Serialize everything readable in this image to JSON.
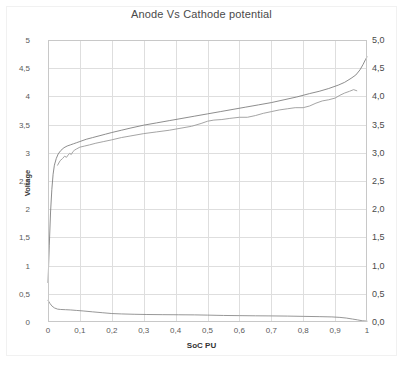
{
  "chart_data": {
    "type": "line",
    "title": "Anode Vs Cathode potential",
    "xlabel": "SoC PU",
    "ylabel": "Voltage",
    "grid": true,
    "legend": "none",
    "xlim": [
      0,
      1
    ],
    "ylim": [
      0,
      5
    ],
    "x_ticks": [
      0,
      0.1,
      0.2,
      0.3,
      0.4,
      0.5,
      0.6,
      0.7,
      0.8,
      0.9,
      1
    ],
    "x_tick_labels": [
      "0",
      "0,1",
      "0,2",
      "0,3",
      "0,4",
      "0,5",
      "0,6",
      "0,7",
      "0,8",
      "0,9",
      "1"
    ],
    "y_ticks_left": [
      0,
      0.5,
      1,
      1.5,
      2,
      2.5,
      3,
      3.5,
      4,
      4.5,
      5
    ],
    "y_tick_labels_left": [
      "0",
      "0,5",
      "1",
      "1,5",
      "2",
      "2,5",
      "3",
      "3,5",
      "4",
      "4,5",
      "5"
    ],
    "y_ticks_right": [
      0,
      0.5,
      1,
      1.5,
      2,
      2.5,
      3,
      3.5,
      4,
      4.5,
      5
    ],
    "y_tick_labels_right": [
      "0,0",
      "0,5",
      "1,0",
      "1,5",
      "2,0",
      "2,5",
      "3,0",
      "3,5",
      "4,0",
      "4,5",
      "5,0"
    ],
    "series": [
      {
        "name": "Cathode potential",
        "axis": "left",
        "color": "#808080",
        "x": [
          0.0,
          0.004,
          0.008,
          0.012,
          0.016,
          0.02,
          0.026,
          0.032,
          0.04,
          0.05,
          0.06,
          0.07,
          0.08,
          0.09,
          0.1,
          0.12,
          0.14,
          0.16,
          0.18,
          0.2,
          0.23,
          0.26,
          0.3,
          0.34,
          0.38,
          0.42,
          0.46,
          0.5,
          0.54,
          0.58,
          0.62,
          0.66,
          0.7,
          0.74,
          0.78,
          0.82,
          0.85,
          0.88,
          0.91,
          0.93,
          0.95,
          0.965,
          0.978,
          0.988,
          0.995,
          1.0
        ],
        "y": [
          0.7,
          1.35,
          1.95,
          2.35,
          2.62,
          2.78,
          2.9,
          2.98,
          3.04,
          3.09,
          3.12,
          3.14,
          3.16,
          3.18,
          3.2,
          3.24,
          3.27,
          3.3,
          3.33,
          3.36,
          3.4,
          3.44,
          3.49,
          3.53,
          3.57,
          3.61,
          3.65,
          3.69,
          3.73,
          3.77,
          3.81,
          3.85,
          3.89,
          3.94,
          3.99,
          4.05,
          4.09,
          4.14,
          4.2,
          4.25,
          4.32,
          4.38,
          4.47,
          4.57,
          4.65,
          4.7
        ]
      },
      {
        "name": "Cell potential",
        "axis": "left",
        "color": "#9a9a9a",
        "x": [
          0.03,
          0.038,
          0.046,
          0.052,
          0.058,
          0.063,
          0.068,
          0.073,
          0.078,
          0.084,
          0.09,
          0.1,
          0.115,
          0.13,
          0.15,
          0.175,
          0.2,
          0.23,
          0.26,
          0.3,
          0.34,
          0.38,
          0.42,
          0.45,
          0.48,
          0.5,
          0.52,
          0.545,
          0.57,
          0.6,
          0.625,
          0.65,
          0.675,
          0.7,
          0.725,
          0.75,
          0.775,
          0.8,
          0.82,
          0.84,
          0.86,
          0.88,
          0.9,
          0.915,
          0.93,
          0.945,
          0.958,
          0.968
        ],
        "y": [
          2.78,
          2.86,
          2.9,
          2.94,
          2.92,
          2.96,
          2.99,
          2.97,
          3.02,
          3.05,
          3.07,
          3.1,
          3.12,
          3.14,
          3.17,
          3.2,
          3.23,
          3.27,
          3.3,
          3.34,
          3.37,
          3.4,
          3.44,
          3.47,
          3.52,
          3.56,
          3.58,
          3.59,
          3.61,
          3.63,
          3.63,
          3.66,
          3.7,
          3.73,
          3.76,
          3.78,
          3.8,
          3.8,
          3.83,
          3.88,
          3.92,
          3.94,
          3.97,
          4.02,
          4.06,
          4.09,
          4.12,
          4.1
        ]
      },
      {
        "name": "Anode potential",
        "axis": "left",
        "color": "#8b8b8b",
        "x": [
          0.0,
          0.006,
          0.012,
          0.02,
          0.03,
          0.04,
          0.055,
          0.07,
          0.09,
          0.11,
          0.14,
          0.17,
          0.2,
          0.23,
          0.27,
          0.31,
          0.36,
          0.41,
          0.46,
          0.5,
          0.55,
          0.6,
          0.65,
          0.7,
          0.75,
          0.8,
          0.85,
          0.89,
          0.915,
          0.935,
          0.955,
          0.97,
          0.985,
          1.0
        ],
        "y": [
          0.385,
          0.33,
          0.285,
          0.25,
          0.228,
          0.222,
          0.218,
          0.214,
          0.205,
          0.196,
          0.18,
          0.165,
          0.15,
          0.143,
          0.137,
          0.133,
          0.13,
          0.128,
          0.126,
          0.122,
          0.116,
          0.113,
          0.11,
          0.108,
          0.105,
          0.1,
          0.095,
          0.09,
          0.082,
          0.07,
          0.052,
          0.038,
          0.022,
          0.015
        ]
      }
    ]
  }
}
